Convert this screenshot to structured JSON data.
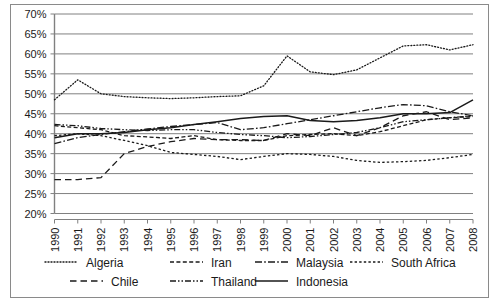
{
  "chart_data": {
    "type": "line",
    "title": "",
    "subtitle": "",
    "xlabel": "",
    "ylabel": "",
    "grid": true,
    "legend_position": "bottom",
    "ylim": [
      20,
      70
    ],
    "ytick_labels": [
      "20%",
      "25%",
      "30%",
      "35%",
      "40%",
      "45%",
      "50%",
      "55%",
      "60%",
      "65%",
      "70%"
    ],
    "ytick_values": [
      20,
      25,
      30,
      35,
      40,
      45,
      50,
      55,
      60,
      65,
      70
    ],
    "categories": [
      "1990",
      "1991",
      "1992",
      "1993",
      "1994",
      "1995",
      "1996",
      "1997",
      "1998",
      "1999",
      "2000",
      "2001",
      "2002",
      "2003",
      "2004",
      "2005",
      "2006",
      "2007",
      "2008"
    ],
    "x": [
      1990,
      1991,
      1992,
      1993,
      1994,
      1995,
      1996,
      1997,
      1998,
      1999,
      2000,
      2001,
      2002,
      2003,
      2004,
      2005,
      2006,
      2007,
      2008
    ],
    "series": [
      {
        "name": "Algeria",
        "dash": "dotted",
        "values": [
          48.5,
          53.5,
          50.0,
          49.3,
          49.0,
          48.8,
          49.0,
          49.3,
          49.5,
          52.0,
          59.5,
          55.5,
          54.8,
          56.0,
          59.0,
          62.0,
          62.3,
          61.0,
          62.3
        ]
      },
      {
        "name": "Iran",
        "dash": "dashed-medium",
        "values": [
          42.0,
          41.5,
          41.0,
          39.5,
          39.2,
          38.8,
          39.5,
          38.5,
          38.3,
          38.3,
          39.5,
          39.8,
          40.0,
          39.5,
          40.5,
          42.0,
          43.5,
          44.0,
          44.3
        ]
      },
      {
        "name": "Malaysia",
        "dash": "dash-dot",
        "values": [
          37.5,
          39.0,
          39.8,
          40.5,
          41.2,
          41.8,
          42.3,
          42.8,
          41.0,
          41.5,
          42.5,
          43.5,
          44.5,
          45.5,
          46.5,
          47.3,
          47.0,
          45.5,
          44.5
        ]
      },
      {
        "name": "South Africa",
        "dash": "dashed-fine",
        "values": [
          39.5,
          40.0,
          39.5,
          38.3,
          37.0,
          35.3,
          34.8,
          34.3,
          33.5,
          34.3,
          35.0,
          34.8,
          34.3,
          33.3,
          32.8,
          33.0,
          33.3,
          34.0,
          34.8
        ]
      },
      {
        "name": "Chile",
        "dash": "dashed-long",
        "values": [
          28.5,
          28.5,
          29.0,
          35.0,
          36.8,
          38.0,
          38.8,
          38.5,
          38.5,
          38.3,
          40.0,
          39.5,
          41.5,
          39.5,
          41.5,
          44.5,
          45.5,
          43.5,
          44.0
        ]
      },
      {
        "name": "Thailand",
        "dash": "dash-dot-dot",
        "values": [
          42.3,
          42.0,
          41.3,
          41.0,
          40.8,
          41.0,
          41.0,
          40.3,
          39.8,
          39.5,
          39.0,
          39.3,
          39.8,
          40.3,
          41.5,
          43.0,
          43.5,
          44.0,
          44.5
        ]
      },
      {
        "name": "Indonesia",
        "dash": "solid",
        "values": [
          39.0,
          40.0,
          40.0,
          40.3,
          41.0,
          41.5,
          42.3,
          43.0,
          43.8,
          44.3,
          44.5,
          43.3,
          43.0,
          43.3,
          44.0,
          45.0,
          45.0,
          45.3,
          48.5
        ]
      }
    ],
    "legend": [
      {
        "label": "Algeria",
        "dash": "dotted"
      },
      {
        "label": "Iran",
        "dash": "dashed-medium"
      },
      {
        "label": "Malaysia",
        "dash": "dash-dot"
      },
      {
        "label": "South Africa",
        "dash": "dashed-fine"
      },
      {
        "label": "Chile",
        "dash": "dashed-long"
      },
      {
        "label": "Thailand",
        "dash": "dash-dot-dot"
      },
      {
        "label": "Indonesia",
        "dash": "solid"
      }
    ],
    "colors": {
      "line": "#1a1a1a",
      "grid": "#808080",
      "axis": "#808080",
      "border": "#8a8a8a",
      "background": "#ffffff"
    }
  }
}
